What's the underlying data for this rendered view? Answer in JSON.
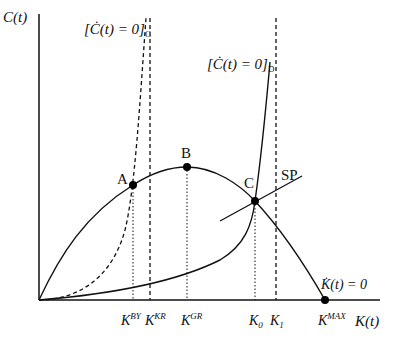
{
  "diagram": {
    "y_axis_label": "C(t)",
    "x_axis_label": "K(t)",
    "curves": {
      "c_dot_zero_C": {
        "label_main": "[Ċ(t) = 0]",
        "label_sub": "C",
        "style": "dashed"
      },
      "c_dot_zero_D": {
        "label_main": "[Ċ(t) = 0]",
        "label_sub": "D",
        "style": "solid"
      },
      "k_dot_zero": {
        "label": "K̇(t) = 0",
        "style": "solid"
      },
      "saddle_path": {
        "label": "SP",
        "style": "solid"
      }
    },
    "points": [
      {
        "id": "A",
        "label": "A"
      },
      {
        "id": "B",
        "label": "B"
      },
      {
        "id": "C",
        "label": "C"
      }
    ],
    "x_ticks": [
      {
        "base": "K",
        "sup": "BY",
        "sub": ""
      },
      {
        "base": "K",
        "sup": "KR",
        "sub": ""
      },
      {
        "base": "K",
        "sup": "GR",
        "sub": ""
      },
      {
        "base": "K",
        "sup": "",
        "sub": "0"
      },
      {
        "base": "K",
        "sup": "",
        "sub": "1"
      },
      {
        "base": "K",
        "sup": "MAX",
        "sub": ""
      }
    ]
  }
}
